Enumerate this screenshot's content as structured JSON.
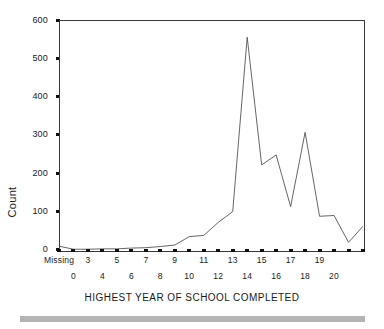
{
  "chart_data": {
    "type": "line",
    "title": "",
    "subtitle": "",
    "xlabel": "HIGHEST YEAR OF SCHOOL COMPLETED",
    "ylabel": "Count",
    "xlim": [
      -1,
      20
    ],
    "ylim": [
      0,
      600
    ],
    "grid": false,
    "legend": null,
    "x_tick_labels_row_top": [
      "Missing",
      "3",
      "5",
      "7",
      "9",
      "11",
      "13",
      "15",
      "17",
      "19"
    ],
    "x_tick_labels_row_bottom": [
      "0",
      "4",
      "6",
      "8",
      "10",
      "12",
      "14",
      "16",
      "18",
      "20"
    ],
    "y_tick_labels": [
      "0",
      "100",
      "200",
      "300",
      "400",
      "500",
      "600"
    ],
    "y_ticks": [
      0,
      100,
      200,
      300,
      400,
      500,
      600
    ],
    "categories": [
      "Missing",
      "0",
      "1",
      "2",
      "3",
      "4",
      "5",
      "6",
      "7",
      "8",
      "9",
      "10",
      "11",
      "12",
      "13",
      "14",
      "15",
      "16",
      "17",
      "18",
      "19",
      "20"
    ],
    "x": [
      -1,
      0,
      1,
      2,
      3,
      4,
      5,
      6,
      7,
      8,
      9,
      10,
      11,
      12,
      13,
      14,
      15,
      16,
      17,
      18,
      19,
      20
    ],
    "values": [
      10,
      2,
      2,
      3,
      3,
      5,
      6,
      9,
      13,
      35,
      38,
      72,
      100,
      555,
      222,
      248,
      113,
      307,
      88,
      90,
      20,
      62
    ],
    "series": [
      {
        "name": "Count",
        "color": "#555555",
        "values": [
          10,
          2,
          2,
          3,
          3,
          5,
          6,
          9,
          13,
          35,
          38,
          72,
          100,
          555,
          222,
          248,
          113,
          307,
          88,
          90,
          20,
          62
        ]
      }
    ],
    "annotations": []
  },
  "axes": {
    "y_title": "Count",
    "x_title": "HIGHEST YEAR OF SCHOOL COMPLETED"
  },
  "footer": {
    "bar_color": "#b4b4b4"
  },
  "style": {
    "line_color": "#555555",
    "axis_color": "#3a3a3a",
    "tick_color": "#111111",
    "background": "#ffffff"
  }
}
